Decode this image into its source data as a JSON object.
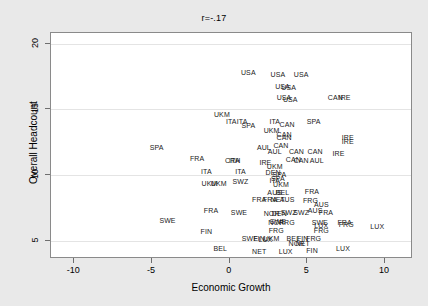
{
  "chart": {
    "title": "r=-.17",
    "xlabel": "Economic Growth",
    "ylabel": "Overall Headcount"
  },
  "chart_data": {
    "type": "scatter",
    "title": "r=-.17",
    "xlabel": "Economic Growth",
    "ylabel": "Overall Headcount",
    "xlim": [
      -11.5,
      11.8
    ],
    "ylim": [
      3.6,
      20.8
    ],
    "xticks": [
      -10,
      -5,
      0,
      5,
      10
    ],
    "xticklabels": [
      "-10",
      "-5",
      "0",
      "5",
      "10"
    ],
    "yticks": [
      5,
      10,
      15,
      20
    ],
    "yticklabels": [
      "5",
      "10",
      "15",
      "20"
    ],
    "grid": "horizontal",
    "legend": "none",
    "marker": "text-label",
    "annotation": "r=-.17",
    "points": [
      {
        "label": "USA",
        "x": 1.2,
        "y": 17.8
      },
      {
        "label": "USA",
        "x": 3.1,
        "y": 17.7
      },
      {
        "label": "USA",
        "x": 4.6,
        "y": 17.7
      },
      {
        "label": "USA",
        "x": 3.4,
        "y": 16.8
      },
      {
        "label": "USA",
        "x": 3.8,
        "y": 16.7
      },
      {
        "label": "USA",
        "x": 3.5,
        "y": 15.9
      },
      {
        "label": "USA",
        "x": 3.9,
        "y": 15.8
      },
      {
        "label": "CAN",
        "x": 6.8,
        "y": 15.9
      },
      {
        "label": "IRE",
        "x": 7.4,
        "y": 15.9
      },
      {
        "label": "UKM",
        "x": -0.5,
        "y": 14.6
      },
      {
        "label": "ITA",
        "x": 0.1,
        "y": 14.1
      },
      {
        "label": "ITA",
        "x": 0.8,
        "y": 14.1
      },
      {
        "label": "SPA",
        "x": 1.2,
        "y": 13.8
      },
      {
        "label": "ITA",
        "x": 2.9,
        "y": 14.1
      },
      {
        "label": "CAN",
        "x": 3.7,
        "y": 13.9
      },
      {
        "label": "SPA",
        "x": 5.4,
        "y": 14.1
      },
      {
        "label": "UKM",
        "x": 2.7,
        "y": 13.4
      },
      {
        "label": "CAN",
        "x": 3.5,
        "y": 13.1
      },
      {
        "label": "CAN",
        "x": 3.5,
        "y": 12.9
      },
      {
        "label": "IRE",
        "x": 7.6,
        "y": 12.9
      },
      {
        "label": "IRE",
        "x": 7.6,
        "y": 12.6
      },
      {
        "label": "SPA",
        "x": -4.7,
        "y": 12.1
      },
      {
        "label": "AUL",
        "x": 2.2,
        "y": 12.1
      },
      {
        "label": "AUL",
        "x": 2.9,
        "y": 11.8
      },
      {
        "label": "CAN",
        "x": 3.3,
        "y": 12.3
      },
      {
        "label": "CAN",
        "x": 4.3,
        "y": 11.8
      },
      {
        "label": "CAN",
        "x": 5.5,
        "y": 11.8
      },
      {
        "label": "IRE",
        "x": 7.0,
        "y": 11.7
      },
      {
        "label": "FRA",
        "x": -2.1,
        "y": 11.3
      },
      {
        "label": "CRH",
        "x": 0.2,
        "y": 11.1
      },
      {
        "label": "ITA",
        "x": 0.3,
        "y": 11.1
      },
      {
        "label": "IRE",
        "x": 2.3,
        "y": 11.0
      },
      {
        "label": "CAN",
        "x": 4.1,
        "y": 11.2
      },
      {
        "label": "CAN",
        "x": 4.6,
        "y": 11.1
      },
      {
        "label": "AUL",
        "x": 5.6,
        "y": 11.1
      },
      {
        "label": "ITA",
        "x": -1.5,
        "y": 10.3
      },
      {
        "label": "ITA",
        "x": 0.7,
        "y": 10.3
      },
      {
        "label": "UKM",
        "x": 2.9,
        "y": 10.7
      },
      {
        "label": "DEN",
        "x": 2.8,
        "y": 10.2
      },
      {
        "label": "SPA",
        "x": 3.2,
        "y": 10.1
      },
      {
        "label": "ITA",
        "x": 2.9,
        "y": 9.6
      },
      {
        "label": "SPA",
        "x": 3.1,
        "y": 9.8
      },
      {
        "label": "UKM",
        "x": -1.3,
        "y": 9.4
      },
      {
        "label": "UKM",
        "x": -0.7,
        "y": 9.4
      },
      {
        "label": "SWZ",
        "x": 0.7,
        "y": 9.5
      },
      {
        "label": "UKM",
        "x": 3.3,
        "y": 9.3
      },
      {
        "label": "AUS",
        "x": 2.9,
        "y": 8.7
      },
      {
        "label": "BEL",
        "x": 3.4,
        "y": 8.7
      },
      {
        "label": "FRA",
        "x": 5.3,
        "y": 8.8
      },
      {
        "label": "FRA",
        "x": 1.9,
        "y": 8.2
      },
      {
        "label": "FRA",
        "x": 2.6,
        "y": 8.2
      },
      {
        "label": "NET",
        "x": 3.1,
        "y": 8.2
      },
      {
        "label": "AUS",
        "x": 3.7,
        "y": 8.2
      },
      {
        "label": "FRG",
        "x": 5.2,
        "y": 8.1
      },
      {
        "label": "AUS",
        "x": 5.9,
        "y": 7.8
      },
      {
        "label": "FRA",
        "x": -1.2,
        "y": 7.3
      },
      {
        "label": "SWE",
        "x": 0.6,
        "y": 7.2
      },
      {
        "label": "NOR",
        "x": 2.7,
        "y": 7.1
      },
      {
        "label": "DEN",
        "x": 3.2,
        "y": 7.1
      },
      {
        "label": "SWZ",
        "x": 3.8,
        "y": 7.2
      },
      {
        "label": "SWZ",
        "x": 4.6,
        "y": 7.2
      },
      {
        "label": "AUS",
        "x": 5.5,
        "y": 7.3
      },
      {
        "label": "FRA",
        "x": 6.2,
        "y": 7.2
      },
      {
        "label": "SWE",
        "x": -4.0,
        "y": 6.6
      },
      {
        "label": "NOR",
        "x": 3.0,
        "y": 6.4
      },
      {
        "label": "SWE",
        "x": 3.1,
        "y": 6.5
      },
      {
        "label": "FRG",
        "x": 3.7,
        "y": 6.4
      },
      {
        "label": "SWE",
        "x": 5.8,
        "y": 6.4
      },
      {
        "label": "LUX",
        "x": 5.9,
        "y": 6.2
      },
      {
        "label": "FRA",
        "x": 7.4,
        "y": 6.4
      },
      {
        "label": "FRG",
        "x": 7.5,
        "y": 6.3
      },
      {
        "label": "LUX",
        "x": 9.5,
        "y": 6.1
      },
      {
        "label": "FIN",
        "x": -1.5,
        "y": 5.7
      },
      {
        "label": "FRG",
        "x": 3.0,
        "y": 5.8
      },
      {
        "label": "FRG",
        "x": 5.9,
        "y": 5.8
      },
      {
        "label": "SWE",
        "x": 1.3,
        "y": 5.2
      },
      {
        "label": "FIN",
        "x": 1.9,
        "y": 5.2
      },
      {
        "label": "LUX",
        "x": 2.3,
        "y": 5.1
      },
      {
        "label": "UKM",
        "x": 2.7,
        "y": 5.2
      },
      {
        "label": "BEL",
        "x": 4.1,
        "y": 5.2
      },
      {
        "label": "FIN",
        "x": 4.7,
        "y": 5.2
      },
      {
        "label": "FRG",
        "x": 5.4,
        "y": 5.2
      },
      {
        "label": "NOR",
        "x": 4.3,
        "y": 4.8
      },
      {
        "label": "NET",
        "x": 4.7,
        "y": 4.8
      },
      {
        "label": "BEL",
        "x": -0.6,
        "y": 4.4
      },
      {
        "label": "NET",
        "x": 1.9,
        "y": 4.2
      },
      {
        "label": "LUX",
        "x": 3.6,
        "y": 4.2
      },
      {
        "label": "FIN",
        "x": 5.3,
        "y": 4.3
      },
      {
        "label": "LUX",
        "x": 7.3,
        "y": 4.4
      }
    ]
  }
}
